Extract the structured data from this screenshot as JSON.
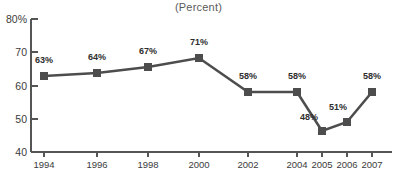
{
  "chart_data": {
    "type": "line",
    "title": "",
    "subtitle": "(Percent)",
    "xlabel": "",
    "ylabel": "",
    "categories": [
      "1994",
      "1996",
      "1998",
      "2000",
      "2002",
      "2004",
      "2005",
      "2006",
      "2007"
    ],
    "values": [
      63,
      64,
      67,
      71,
      58,
      58,
      48,
      51,
      58
    ],
    "point_labels": [
      "63%",
      "64%",
      "67%",
      "71%",
      "58%",
      "58%",
      "48%",
      "51%",
      "58%"
    ],
    "series": [
      {
        "name": "Percent",
        "values": [
          63,
          64,
          67,
          71,
          58,
          58,
          48,
          51,
          58
        ]
      }
    ],
    "ylim": [
      40,
      80
    ],
    "yticks": [
      40,
      50,
      60,
      70,
      80
    ],
    "ytick_labels": [
      "40",
      "50",
      "60",
      "70",
      "80%"
    ],
    "xtick_labels": [
      "1994",
      "1996",
      "1998",
      "2000",
      "2002",
      "2004",
      "2005",
      "2006",
      "2007"
    ],
    "grid": false,
    "legend": "none",
    "marker": "square",
    "line_color": "#4d4d4d",
    "marker_color": "#4d4d4d",
    "axis_color": "#555555",
    "label_color": "#2e2e2e",
    "background": "#ffffff",
    "label_offsets": [
      {
        "dx": 0,
        "dy": -13
      },
      {
        "dx": 0,
        "dy": -13
      },
      {
        "dx": 0,
        "dy": -13
      },
      {
        "dx": 0,
        "dy": -13
      },
      {
        "dx": 0,
        "dy": -13
      },
      {
        "dx": 0,
        "dy": -13
      },
      {
        "dx": -13,
        "dy": -11
      },
      {
        "dx": -9,
        "dy": -12
      },
      {
        "dx": 0,
        "dy": -13
      }
    ],
    "point_x": [
      44,
      97,
      148,
      199,
      248,
      297,
      322,
      347,
      372
    ],
    "point_y": [
      76,
      73,
      67,
      58,
      92,
      92,
      131,
      122,
      92
    ],
    "xtick_x": [
      44,
      97,
      148,
      199,
      248,
      297,
      322,
      347,
      372
    ],
    "ytick_y": [
      152,
      119,
      86,
      52,
      19
    ],
    "axis_left_x": 31,
    "axis_bottom_y": 152,
    "axis_top_y": 19,
    "axis_right_x": 392
  }
}
